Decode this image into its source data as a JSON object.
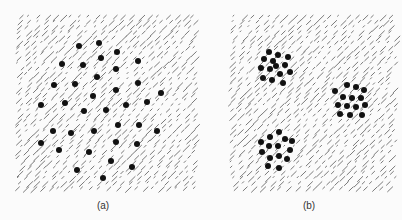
{
  "figure": {
    "panels": [
      {
        "label": "(a)",
        "description": "dots randomly dispersed over oriented line texture",
        "dots": [
          [
            79,
            46
          ],
          [
            99,
            43
          ],
          [
            117,
            52
          ],
          [
            101,
            58
          ],
          [
            62,
            64
          ],
          [
            83,
            65
          ],
          [
            138,
            61
          ],
          [
            116,
            69
          ],
          [
            97,
            77
          ],
          [
            54,
            85
          ],
          [
            75,
            84
          ],
          [
            138,
            83
          ],
          [
            116,
            90
          ],
          [
            161,
            93
          ],
          [
            93,
            96
          ],
          [
            65,
            103
          ],
          [
            41,
            105
          ],
          [
            126,
            105
          ],
          [
            147,
            102
          ],
          [
            84,
            111
          ],
          [
            106,
            110
          ],
          [
            118,
            125
          ],
          [
            139,
            125
          ],
          [
            53,
            131
          ],
          [
            71,
            133
          ],
          [
            94,
            131
          ],
          [
            157,
            131
          ],
          [
            41,
            143
          ],
          [
            116,
            142
          ],
          [
            137,
            144
          ],
          [
            59,
            150
          ],
          [
            89,
            152
          ],
          [
            111,
            161
          ],
          [
            132,
            167
          ],
          [
            77,
            170
          ],
          [
            103,
            178
          ]
        ]
      },
      {
        "label": "(b)",
        "description": "dots grouped in three clusters over oriented line texture",
        "dots": [
          [
            269,
            52
          ],
          [
            278,
            55
          ],
          [
            288,
            57
          ],
          [
            264,
            59
          ],
          [
            273,
            61
          ],
          [
            276,
            66
          ],
          [
            285,
            65
          ],
          [
            261,
            68
          ],
          [
            270,
            69
          ],
          [
            290,
            72
          ],
          [
            280,
            74
          ],
          [
            263,
            78
          ],
          [
            272,
            80
          ],
          [
            283,
            83
          ],
          [
            347,
            85
          ],
          [
            356,
            87
          ],
          [
            335,
            91
          ],
          [
            364,
            90
          ],
          [
            343,
            97
          ],
          [
            352,
            98
          ],
          [
            361,
            98
          ],
          [
            338,
            105
          ],
          [
            347,
            106
          ],
          [
            356,
            107
          ],
          [
            365,
            105
          ],
          [
            340,
            114
          ],
          [
            350,
            115
          ],
          [
            362,
            115
          ],
          [
            279,
            132
          ],
          [
            270,
            137
          ],
          [
            285,
            139
          ],
          [
            261,
            142
          ],
          [
            269,
            146
          ],
          [
            278,
            146
          ],
          [
            292,
            141
          ],
          [
            262,
            152
          ],
          [
            290,
            150
          ],
          [
            270,
            158
          ],
          [
            279,
            156
          ],
          [
            287,
            159
          ],
          [
            268,
            166
          ],
          [
            279,
            168
          ]
        ]
      }
    ],
    "colors": {
      "background": "#fbfbfb",
      "lines": "#7a7a7a",
      "dots": "#111111",
      "text": "#333333"
    }
  }
}
